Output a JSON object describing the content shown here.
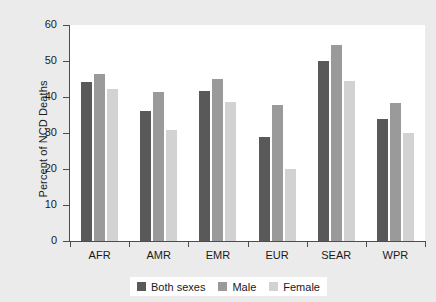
{
  "chart_data": {
    "type": "bar",
    "title": "",
    "subtitle": "",
    "xlabel": "",
    "ylabel": "Percent of NCD Deaths",
    "categories": [
      "AFR",
      "AMR",
      "EMR",
      "EUR",
      "SEAR",
      "WPR"
    ],
    "series": [
      {
        "name": "Both sexes",
        "color": "#595959",
        "values": [
          44.2,
          36.0,
          41.8,
          28.8,
          50.0,
          34.0
        ]
      },
      {
        "name": "Male",
        "color": "#9a9a9a",
        "values": [
          46.5,
          41.3,
          45.0,
          37.8,
          54.5,
          38.3
        ]
      },
      {
        "name": "Female",
        "color": "#d2d2d2",
        "values": [
          42.2,
          30.8,
          38.5,
          20.0,
          44.5,
          30.0
        ]
      }
    ],
    "ylim": [
      0,
      60
    ],
    "yticks": [
      0,
      10,
      20,
      30,
      40,
      50,
      60
    ],
    "ytick_labels": [
      "0",
      "10",
      "20",
      "30",
      "40",
      "50",
      "60"
    ],
    "grid": false,
    "legend_position": "bottom-center",
    "plot_background": "#ffffff",
    "figure_background": "#ebebeb",
    "axis_color": "#4d4d4d"
  }
}
